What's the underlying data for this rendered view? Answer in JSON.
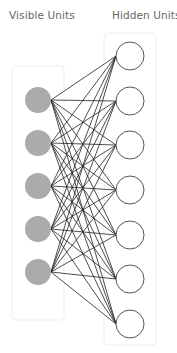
{
  "labels": {
    "visible": "Visible Units",
    "hidden": "Hidden Units"
  },
  "colors": {
    "visible_fill": "#ababab",
    "hidden_stroke": "#555555",
    "edge": "#222222",
    "group_box": "#eeeeee",
    "label": "#666666"
  },
  "visible_units": {
    "count": 5,
    "cx": 38,
    "r": 13,
    "cy": [
      100,
      143,
      186,
      229,
      272
    ]
  },
  "hidden_units": {
    "count": 7,
    "cx": 130,
    "r": 14,
    "cy": [
      56,
      101,
      145,
      190,
      235,
      279,
      324
    ]
  },
  "group_boxes": {
    "visible": {
      "x": 12,
      "y": 66,
      "w": 52,
      "h": 254
    },
    "hidden": {
      "x": 104,
      "y": 33,
      "w": 52,
      "h": 312
    }
  },
  "edges": "fully-connected"
}
